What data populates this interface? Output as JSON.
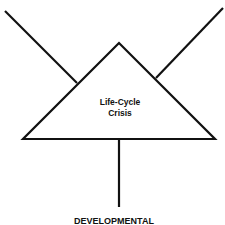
{
  "diagram": {
    "center_node": {
      "shape": "triangle",
      "label_line1": "Life-Cycle",
      "label_line2": "Crisis"
    },
    "bottom_label": "DEVELOPMENTAL",
    "line_color": "#111111",
    "background": "#ffffff"
  }
}
